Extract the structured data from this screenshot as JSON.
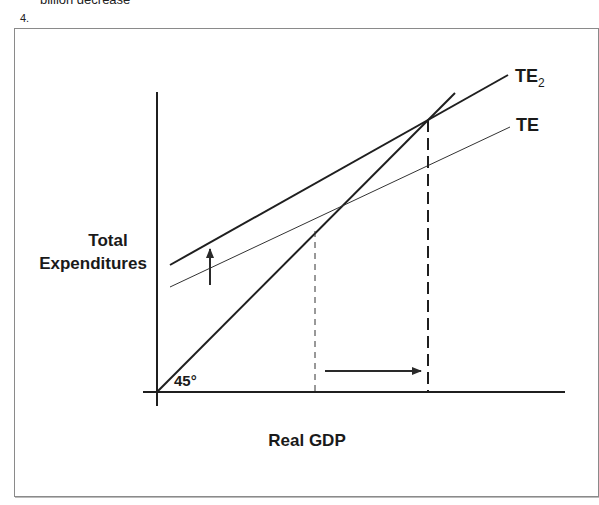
{
  "header": {
    "cut_text": "billion decrease",
    "question_number": "4."
  },
  "diagram": {
    "y_axis_label_line1": "Total",
    "y_axis_label_line2": "Expenditures",
    "x_axis_label": "Real GDP",
    "angle_label": "45°",
    "curve_te2": "TE",
    "curve_te2_sub": "2",
    "curve_te": "TE"
  },
  "colors": {
    "line": "#1f1f1f",
    "frame": "#8a8a8a"
  }
}
